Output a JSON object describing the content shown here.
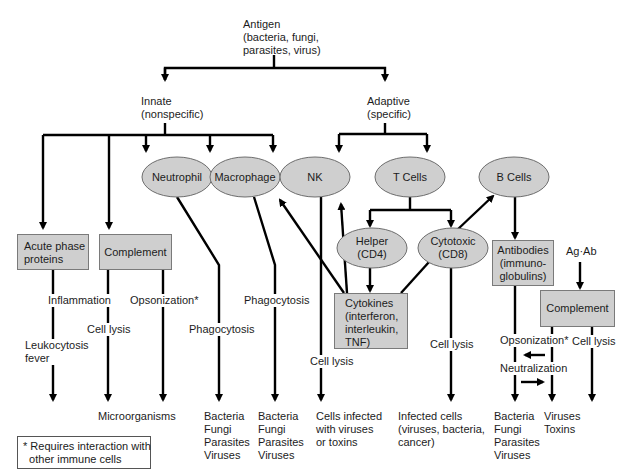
{
  "diagram": {
    "root": {
      "label": "Antigen\n(bacteria, fungi,\nparasites, virus)"
    },
    "branches": {
      "innate": {
        "label": "Innate\n(nonspecific)"
      },
      "adaptive": {
        "label": "Adaptive\n(specific)"
      }
    },
    "cells": {
      "neutrophil": "Neutrophil",
      "macrophage": "Macrophage",
      "nk": "NK",
      "t_cells": "T Cells",
      "b_cells": "B Cells",
      "helper": "Helper\n(CD4)",
      "cytotoxic": "Cytotoxic\n(CD8)"
    },
    "boxes": {
      "acute_phase": "Acute phase\nproteins",
      "complement_innate": "Complement",
      "cytokines": "Cytokines\n(interferon,\ninterleukin,\nTNF)",
      "antibodies": "Antibodies\n(immuno-\nglobulins)",
      "complement_adaptive": "Complement"
    },
    "edge_labels": {
      "inflammation": "Inflammation",
      "leukocytosis": "Leukocytosis\nfever",
      "cell_lysis_complement": "Cell lysis",
      "opsonization_innate": "Opsonization*",
      "phagocytosis_neutrophil": "Phagocytosis",
      "phagocytosis_macrophage": "Phagocytosis",
      "cell_lysis_nk": "Cell lysis",
      "cell_lysis_cd8": "Cell lysis",
      "ag_ab": "Ag·Ab",
      "opsonization_adaptive": "Opsonization*",
      "neutralization": "Neutralization",
      "cell_lysis_complement_adaptive": "Cell lysis"
    },
    "targets": {
      "microorganisms": "Microorganisms",
      "neutrophil_targets": "Bacteria\nFungi\nParasites\nViruses",
      "macrophage_targets": "Bacteria\nFungi\nParasites\nViruses",
      "nk_targets": "Cells infected\nwith viruses\nor toxins",
      "cd8_targets": "Infected cells\n(viruses, bacteria,\ncancer)",
      "antibody_targets": "Bacteria\nFungi\nParasites\nViruses",
      "neutralization_targets": "Viruses\nToxins"
    },
    "footnote": "* Requires interaction with\n  other immune cells",
    "colors": {
      "node_fill": "#cfcfcf",
      "node_stroke": "#6e6e6e",
      "line": "#000000",
      "background": "#ffffff"
    }
  }
}
